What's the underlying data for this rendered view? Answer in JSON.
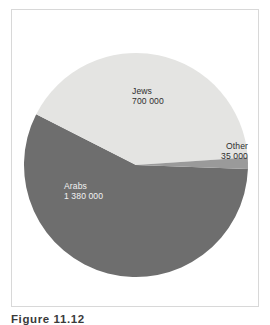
{
  "figure": {
    "caption": "Figure 11.12",
    "frame_color": "#d8d8d8",
    "background": "#ffffff"
  },
  "chart_data": {
    "type": "pie",
    "title": "",
    "subtitle": "",
    "xlabel": "",
    "ylabel": "",
    "legend_position": "none",
    "grid": false,
    "total": 2115000,
    "categories": [
      "Jews",
      "Other",
      "Arabs"
    ],
    "values": [
      700000,
      35000,
      1380000
    ],
    "value_labels": [
      "700 000",
      "35 000",
      "1 380 000"
    ],
    "percentages": [
      33.1,
      1.65,
      65.25
    ],
    "colors": [
      "#e4e4e2",
      "#9a9a9a",
      "#6e6e6e"
    ],
    "label_colors": [
      "#2e2e2e",
      "#2e2e2e",
      "#f2f2f2"
    ],
    "slices": [
      {
        "name": "Jews",
        "value": 700000,
        "value_label": "700 000",
        "percent": 33.1,
        "color": "#e4e4e2",
        "label_color": "#2e2e2e",
        "start_angle": 297.0,
        "end_angle": 86.2
      },
      {
        "name": "Other",
        "value": 35000,
        "value_label": "35 000",
        "percent": 1.65,
        "color": "#9a9a9a",
        "label_color": "#2e2e2e",
        "start_angle": 86.2,
        "end_angle": 92.1
      },
      {
        "name": "Arabs",
        "value": 1380000,
        "value_label": "1 380 000",
        "percent": 65.25,
        "color": "#6e6e6e",
        "label_color": "#f2f2f2",
        "start_angle": 92.1,
        "end_angle": 297.0
      }
    ],
    "geometry": {
      "center_x": 136,
      "center_y": 165,
      "radius": 112
    }
  },
  "labels": {
    "jews": {
      "name": "Jews",
      "value": "700 000"
    },
    "other": {
      "name": "Other",
      "value": "35 000"
    },
    "arabs": {
      "name": "Arabs",
      "value": "1 380 000"
    }
  }
}
